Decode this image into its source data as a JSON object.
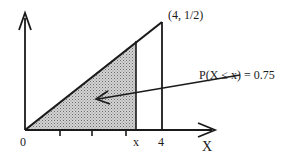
{
  "diagram": {
    "point_label": "(4, 1/2)",
    "probability_label": "P(X ≤ x) = 0.75",
    "origin_label": "0",
    "x_marker_label": "x",
    "four_label": "4",
    "axis_label": "X",
    "colors": {
      "ink": "#1a1a1a",
      "shade": "#b8b8b8"
    }
  }
}
